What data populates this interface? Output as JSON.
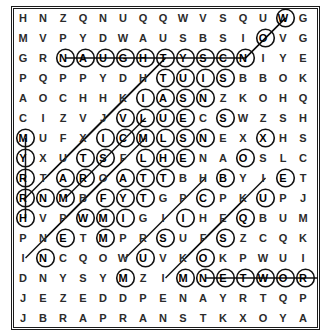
{
  "puzzle": {
    "title": "word-search-grid",
    "rows": 16,
    "cols": 15,
    "cell_size": 20,
    "ink_color": "#111111",
    "paper_color": "#ffffff",
    "grid": [
      [
        "H",
        "N",
        "Z",
        "Q",
        "N",
        "U",
        "Q",
        "Q",
        "W",
        "V",
        "S",
        "Q",
        "U",
        "W",
        "G",
        "G"
      ],
      [
        "M",
        "V",
        "P",
        "Y",
        "D",
        "W",
        "A",
        "U",
        "S",
        "B",
        "S",
        "I",
        "O",
        "V",
        "G",
        "P"
      ],
      [
        "G",
        "R",
        "N",
        "A",
        "U",
        "G",
        "H",
        "T",
        "Y",
        "S",
        "C",
        "N",
        "I",
        "Y",
        "E",
        "U"
      ],
      [
        "P",
        "Q",
        "P",
        "P",
        "Y",
        "D",
        "H",
        "T",
        "U",
        "I",
        "S",
        "B",
        "B",
        "O",
        "K",
        "U"
      ],
      [
        "A",
        "O",
        "C",
        "H",
        "H",
        "K",
        "I",
        "A",
        "S",
        "N",
        "Z",
        "K",
        "O",
        "H",
        "Q",
        "I"
      ],
      [
        "C",
        "I",
        "Z",
        "V",
        "J",
        "V",
        "L",
        "U",
        "E",
        "C",
        "S",
        "W",
        "Z",
        "S",
        "H",
        "G"
      ],
      [
        "M",
        "U",
        "F",
        "X",
        "I",
        "C",
        "M",
        "L",
        "S",
        "N",
        "E",
        "X",
        "X",
        "H",
        "S",
        "E"
      ],
      [
        "Y",
        "X",
        "U",
        "T",
        "S",
        "F",
        "L",
        "H",
        "E",
        "N",
        "A",
        "O",
        "S",
        "L",
        "C",
        "T"
      ],
      [
        "R",
        "T",
        "A",
        "R",
        "O",
        "A",
        "T",
        "T",
        "B",
        "H",
        "B",
        "Y",
        "I",
        "E",
        "T",
        "A"
      ],
      [
        "R",
        "N",
        "M",
        "B",
        "F",
        "Y",
        "T",
        "G",
        "P",
        "C",
        "P",
        "K",
        "U",
        "P",
        "J",
        "O"
      ],
      [
        "H",
        "V",
        "P",
        "W",
        "M",
        "I",
        "G",
        "I",
        "I",
        "H",
        "E",
        "Q",
        "B",
        "U",
        "M",
        "T"
      ],
      [
        "P",
        "N",
        "E",
        "T",
        "M",
        "P",
        "R",
        "S",
        "U",
        "F",
        "S",
        "Z",
        "C",
        "Q",
        "K",
        "C"
      ],
      [
        "I",
        "N",
        "C",
        "Q",
        "O",
        "W",
        "U",
        "V",
        "K",
        "O",
        "K",
        "P",
        "W",
        "U",
        "I",
        "R"
      ],
      [
        "D",
        "N",
        "Y",
        "S",
        "Y",
        "M",
        "Z",
        "I",
        "M",
        "N",
        "E",
        "T",
        "W",
        "O",
        "R",
        "K"
      ],
      [
        "J",
        "E",
        "Z",
        "E",
        "D",
        "D",
        "P",
        "E",
        "N",
        "A",
        "Y",
        "R",
        "T",
        "Q",
        "P",
        "L"
      ],
      [
        "J",
        "B",
        "R",
        "A",
        "P",
        "R",
        "A",
        "N",
        "S",
        "T",
        "K",
        "X",
        "O",
        "Y",
        "A",
        "Y"
      ]
    ],
    "circled": [
      [
        2,
        2
      ],
      [
        2,
        3
      ],
      [
        2,
        4
      ],
      [
        2,
        5
      ],
      [
        2,
        6
      ],
      [
        2,
        7
      ],
      [
        2,
        8
      ],
      [
        2,
        9
      ],
      [
        2,
        10
      ],
      [
        2,
        11
      ],
      [
        0,
        13
      ],
      [
        1,
        12
      ],
      [
        3,
        7
      ],
      [
        3,
        8
      ],
      [
        3,
        9
      ],
      [
        3,
        10
      ],
      [
        4,
        6
      ],
      [
        4,
        7
      ],
      [
        4,
        8
      ],
      [
        4,
        9
      ],
      [
        5,
        5
      ],
      [
        5,
        6
      ],
      [
        5,
        7
      ],
      [
        5,
        8
      ],
      [
        5,
        10
      ],
      [
        6,
        0
      ],
      [
        6,
        4
      ],
      [
        6,
        5
      ],
      [
        6,
        6
      ],
      [
        6,
        7
      ],
      [
        6,
        8
      ],
      [
        6,
        9
      ],
      [
        6,
        12
      ],
      [
        7,
        0
      ],
      [
        7,
        3
      ],
      [
        7,
        4
      ],
      [
        7,
        6
      ],
      [
        7,
        7
      ],
      [
        7,
        8
      ],
      [
        7,
        11
      ],
      [
        8,
        0
      ],
      [
        8,
        2
      ],
      [
        8,
        3
      ],
      [
        8,
        5
      ],
      [
        8,
        6
      ],
      [
        8,
        7
      ],
      [
        8,
        10
      ],
      [
        8,
        13
      ],
      [
        9,
        0
      ],
      [
        9,
        1
      ],
      [
        9,
        2
      ],
      [
        9,
        4
      ],
      [
        9,
        5
      ],
      [
        9,
        6
      ],
      [
        9,
        9
      ],
      [
        9,
        12
      ],
      [
        10,
        0
      ],
      [
        10,
        3
      ],
      [
        10,
        4
      ],
      [
        10,
        5
      ],
      [
        10,
        8
      ],
      [
        10,
        11
      ],
      [
        11,
        2
      ],
      [
        11,
        4
      ],
      [
        11,
        7
      ],
      [
        11,
        10
      ],
      [
        12,
        1
      ],
      [
        12,
        6
      ],
      [
        12,
        9
      ],
      [
        13,
        5
      ],
      [
        13,
        8
      ],
      [
        13,
        9
      ],
      [
        13,
        10
      ],
      [
        13,
        11
      ],
      [
        13,
        12
      ],
      [
        13,
        13
      ],
      [
        13,
        14
      ],
      [
        13,
        15
      ]
    ],
    "found_words": [
      {
        "word": "NAUGHTYSCN",
        "label": "NAUGHTY",
        "direction": "horizontal",
        "row": 2,
        "start_col": 2,
        "end_col": 11
      },
      {
        "word": "NETWORK",
        "label": "NETWORK",
        "direction": "horizontal",
        "row": 13,
        "start_col": 9,
        "end_col": 15
      },
      {
        "word": "MYRRH",
        "label": "MYRRH",
        "direction": "vertical",
        "col": 0,
        "start_row": 6,
        "end_row": 10
      },
      {
        "word": "NOW",
        "label": "NOW",
        "direction": "diagonal-up-right",
        "start": [
          2,
          11
        ],
        "end": [
          0,
          13
        ]
      },
      {
        "word": "VALUE",
        "label": "VALUE",
        "direction": "diagonal-up-right",
        "start": [
          9,
          2
        ],
        "end": [
          5,
          6
        ]
      }
    ]
  }
}
